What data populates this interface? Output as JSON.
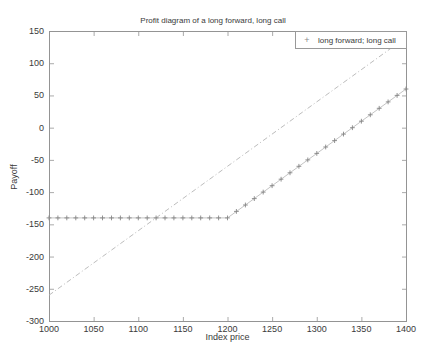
{
  "figure": {
    "title": "Profit diagram of a long forward, long call"
  },
  "axes": {
    "xlabel": "Index price",
    "ylabel": "Payoff"
  },
  "legend": {
    "marker": "+",
    "entries": [
      "long forward; long call"
    ],
    "position": "top-right"
  },
  "chart_data": {
    "type": "line",
    "title": "Profit diagram of a long forward, long call",
    "xlabel": "Index price",
    "ylabel": "Payoff",
    "xlim": [
      1000,
      1400
    ],
    "ylim": [
      -300,
      150
    ],
    "xticks": [
      1000,
      1050,
      1100,
      1150,
      1200,
      1250,
      1300,
      1350,
      1400
    ],
    "yticks": [
      150,
      100,
      50,
      0,
      -50,
      -100,
      -150,
      -200,
      -250,
      -300
    ],
    "grid": false,
    "legend_position": "top-right",
    "series": [
      {
        "name": "long forward",
        "style": "dashdot",
        "color": "#b4b4b4",
        "marker": "none",
        "points": [
          [
            1000,
            -260
          ],
          [
            1400,
            140
          ]
        ]
      },
      {
        "name": "long call",
        "style": "solid",
        "color": "#bdbdbd",
        "marker": "+",
        "marker_color": "#868686",
        "marker_step": 10,
        "points": [
          [
            1000,
            -140
          ],
          [
            1200,
            -140
          ],
          [
            1400,
            60
          ]
        ]
      }
    ],
    "colors": {
      "axis": "#949494",
      "text": "#3a3a3a",
      "background": "#ffffff"
    }
  }
}
